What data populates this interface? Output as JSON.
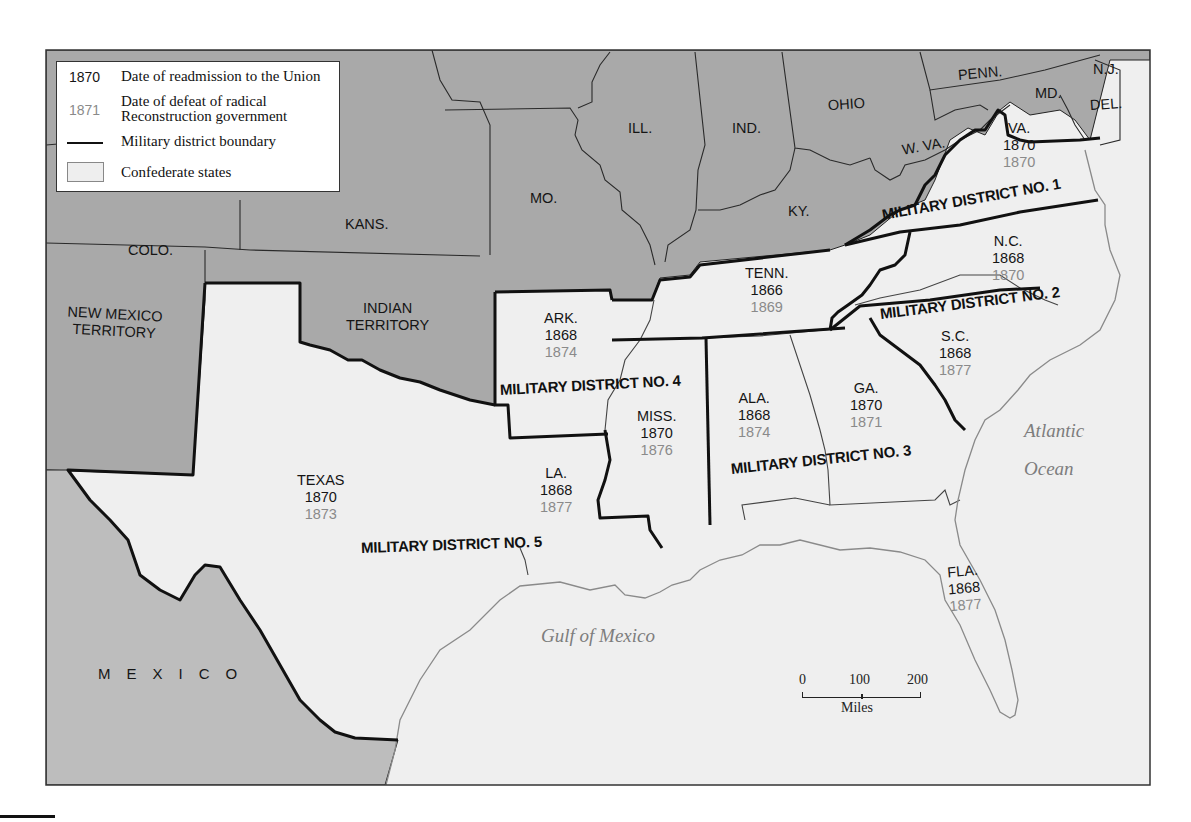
{
  "legend": {
    "readmission_key": "1870",
    "readmission_text": "Date of readmission to the Union",
    "defeat_key": "1871",
    "defeat_text_line1": "Date of defeat of radical",
    "defeat_text_line2": "Reconstruction government",
    "boundary_text": "Military district boundary",
    "confederate_text": "Confederate states"
  },
  "colors": {
    "union_states": "#a9a9a9",
    "confederate_states": "#efefef",
    "mexico": "#bdbdbd",
    "readmission_year": "#151515",
    "defeat_year": "#8a8a8a",
    "district_boundary": "#111111"
  },
  "non_confederate_labels": {
    "colo": "COLO.",
    "kans": "KANS.",
    "mo": "MO.",
    "ill": "ILL.",
    "ind": "IND.",
    "ohio": "OHIO",
    "ky": "KY.",
    "wva": "W. VA.",
    "penn": "PENN.",
    "md": "MD.",
    "nj": "N.J.",
    "del": "DEL.",
    "nm_line1": "NEW MEXICO",
    "nm_line2": "TERRITORY",
    "indian_line1": "INDIAN",
    "indian_line2": "TERRITORY",
    "mexico": "MEXICO"
  },
  "confederate_states": [
    {
      "name": "VA.",
      "readmitted": "1870",
      "defeated": "1870"
    },
    {
      "name": "N.C.",
      "readmitted": "1868",
      "defeated": "1870"
    },
    {
      "name": "TENN.",
      "readmitted": "1866",
      "defeated": "1869"
    },
    {
      "name": "S.C.",
      "readmitted": "1868",
      "defeated": "1877"
    },
    {
      "name": "ARK.",
      "readmitted": "1868",
      "defeated": "1874"
    },
    {
      "name": "ALA.",
      "readmitted": "1868",
      "defeated": "1874"
    },
    {
      "name": "GA.",
      "readmitted": "1870",
      "defeated": "1871"
    },
    {
      "name": "MISS.",
      "readmitted": "1870",
      "defeated": "1876"
    },
    {
      "name": "TEXAS",
      "readmitted": "1870",
      "defeated": "1873"
    },
    {
      "name": "LA.",
      "readmitted": "1868",
      "defeated": "1877"
    },
    {
      "name": "FLA.",
      "readmitted": "1868",
      "defeated": "1877"
    }
  ],
  "military_districts": [
    "MILITARY DISTRICT NO. 1",
    "MILITARY DISTRICT NO. 2",
    "MILITARY DISTRICT NO. 3",
    "MILITARY DISTRICT NO. 4",
    "MILITARY DISTRICT NO. 5"
  ],
  "water_labels": {
    "atlantic_line1": "Atlantic",
    "atlantic_line2": "Ocean",
    "gulf": "Gulf of Mexico"
  },
  "scale_bar": {
    "ticks": [
      "0",
      "100",
      "200"
    ],
    "unit": "Miles"
  }
}
